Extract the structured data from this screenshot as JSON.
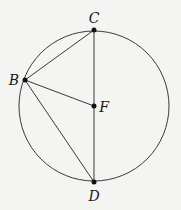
{
  "diagram": {
    "type": "circle-geometry",
    "circle": {
      "cx": 94,
      "cy": 106,
      "r": 75,
      "stroke": "#3a3a3a"
    },
    "points": [
      {
        "id": "C",
        "label": "C",
        "x": 94,
        "y": 30,
        "lx": 94,
        "ly": 23
      },
      {
        "id": "B",
        "label": "B",
        "x": 25,
        "y": 80,
        "lx": 14,
        "ly": 85
      },
      {
        "id": "F",
        "label": "F",
        "x": 94,
        "y": 106,
        "lx": 104,
        "ly": 112
      },
      {
        "id": "D",
        "label": "D",
        "x": 94,
        "y": 182,
        "lx": 94,
        "ly": 201
      }
    ],
    "segments": [
      {
        "from": "C",
        "to": "D"
      },
      {
        "from": "B",
        "to": "C"
      },
      {
        "from": "B",
        "to": "F"
      },
      {
        "from": "B",
        "to": "D"
      }
    ],
    "colors": {
      "background": "#f4f4f2",
      "ink": "#1a1a1a",
      "line": "#3a3a3a"
    }
  }
}
